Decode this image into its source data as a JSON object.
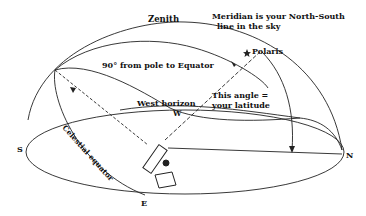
{
  "diagram": {
    "labels": {
      "zenith": "Zenith",
      "meridian_line1": "Meridian is your North-South",
      "meridian_line2": "line in the sky",
      "polaris": "Polaris",
      "ninety": "90° from pole to Equator",
      "west_horizon": "West horizon",
      "west": "W",
      "angle_line1": "This angle =",
      "angle_line2": "your latitude",
      "south": "S",
      "north": "N",
      "east": "E",
      "celestial_equator": "Celestial equator"
    },
    "colors": {
      "line": "#222222",
      "background": "#ffffff"
    }
  }
}
